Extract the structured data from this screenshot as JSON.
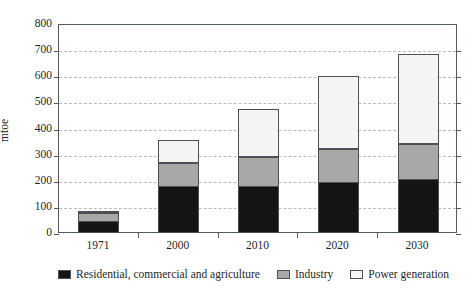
{
  "chart_data": {
    "type": "bar",
    "subtype": "stacked-vertical",
    "title": "",
    "subtitle": "",
    "xlabel": "",
    "ylabel": "mtoe",
    "categories": [
      "1971",
      "2000",
      "2010",
      "2020",
      "2030"
    ],
    "ylim": [
      0,
      800
    ],
    "yticks": [
      0,
      100,
      200,
      300,
      400,
      500,
      600,
      700,
      800
    ],
    "ytick_labels": [
      "0",
      "100",
      "200",
      "300",
      "400",
      "500",
      "600",
      "700",
      "800"
    ],
    "grid": "horizontal-dashed",
    "legend_position": "bottom",
    "series": [
      {
        "name": "Residential, commercial and agriculture",
        "color": "#141414",
        "values": [
          45,
          180,
          180,
          195,
          205
        ]
      },
      {
        "name": "Industry",
        "color": "#a8a8a8",
        "values": [
          35,
          90,
          115,
          130,
          140
        ]
      },
      {
        "name": "Power generation",
        "color": "#f4f4f4",
        "values": [
          10,
          90,
          185,
          280,
          345
        ]
      }
    ],
    "totals": [
      90,
      360,
      480,
      605,
      690
    ]
  },
  "axes": {
    "y_title": "mtoe",
    "y_tick_labels": [
      "800",
      "700",
      "600",
      "500",
      "400",
      "300",
      "200",
      "100",
      "0"
    ],
    "x_tick_labels": [
      "1971",
      "2000",
      "2010",
      "2020",
      "2030"
    ]
  },
  "legend": {
    "items": [
      {
        "label": "Residential, commercial and agriculture",
        "color": "#141414"
      },
      {
        "label": "Industry",
        "color": "#a8a8a8"
      },
      {
        "label": "Power generation",
        "color": "#f4f4f4"
      }
    ]
  },
  "colors": {
    "frame": "#555a5e",
    "grid": "#b9bcc0",
    "segment_border": "#4c5053",
    "text": "#1f1f1f",
    "background": "#ffffff"
  }
}
